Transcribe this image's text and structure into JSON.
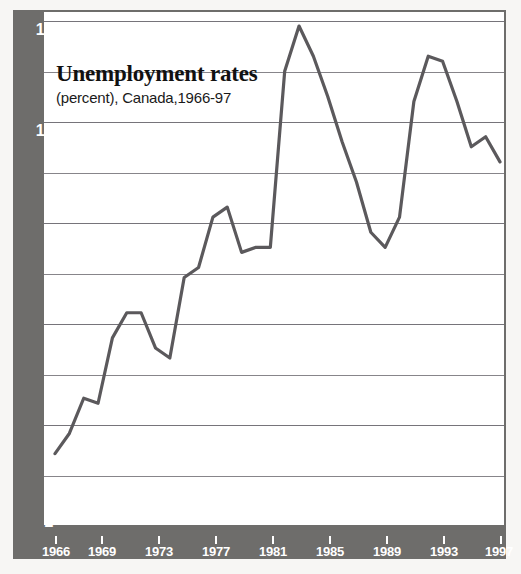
{
  "chart_data": {
    "type": "line",
    "title": "Unemployment rates",
    "subtitle": "(percent), Canada,1966-97",
    "xlabel": "",
    "ylabel": "",
    "ylim": [
      2,
      12
    ],
    "xlim": [
      1966,
      1997
    ],
    "grid": true,
    "legend": false,
    "y_ticks": [
      2,
      4,
      6,
      8,
      10,
      12
    ],
    "y_minor_ticks": [
      3,
      5,
      7,
      9,
      11
    ],
    "x_ticks": [
      1966,
      1969,
      1973,
      1977,
      1981,
      1985,
      1989,
      1993,
      1997
    ],
    "x": [
      1966,
      1967,
      1968,
      1969,
      1970,
      1971,
      1972,
      1973,
      1974,
      1975,
      1976,
      1977,
      1978,
      1979,
      1980,
      1981,
      1982,
      1983,
      1984,
      1985,
      1986,
      1987,
      1988,
      1989,
      1990,
      1991,
      1992,
      1993,
      1994,
      1995,
      1996,
      1997
    ],
    "values": [
      3.4,
      3.8,
      4.5,
      4.4,
      5.7,
      6.2,
      6.2,
      5.5,
      5.3,
      6.9,
      7.1,
      8.1,
      8.3,
      7.4,
      7.5,
      7.5,
      11.0,
      11.9,
      11.3,
      10.5,
      9.6,
      8.8,
      7.8,
      7.5,
      8.1,
      10.4,
      11.3,
      11.2,
      10.4,
      9.5,
      9.7,
      9.2
    ],
    "series_color": "#5b595c",
    "panel_color": "#6e6d6b",
    "plot_bg": "#ffffff",
    "tick_label_color": "#ffffff",
    "gridline_color": "#87858a"
  },
  "axis": {
    "y_tick_labels": [
      "12",
      "10",
      "8",
      "6",
      "4",
      "2"
    ],
    "x_tick_labels": [
      "1966",
      "1969",
      "1973",
      "1977",
      "1981",
      "1985",
      "1989",
      "1993",
      "1997"
    ]
  }
}
